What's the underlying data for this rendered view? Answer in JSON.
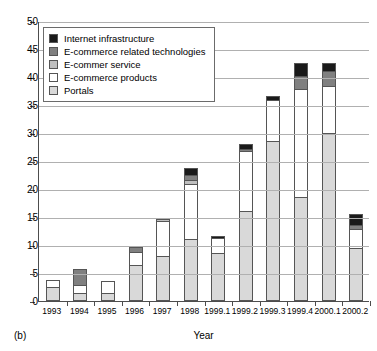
{
  "chart_data": {
    "type": "bar",
    "subtype": "stacked-bar",
    "title": "",
    "panel_label": "(b)",
    "xlabel": "Year",
    "ylabel": "",
    "ylim": [
      0,
      50
    ],
    "ytick_step": 5,
    "ytick_labels": [
      "0",
      "5",
      "10",
      "15",
      "20",
      "25",
      "30",
      "35",
      "40",
      "45",
      "50"
    ],
    "grid": true,
    "grid_axis": "y",
    "legend_position": "top-left",
    "categories": [
      "1993",
      "1994",
      "1995",
      "1996",
      "1997",
      "1998",
      "1999.1",
      "1999.2",
      "1999.3",
      "1999.4",
      "2000.1",
      "2000.2"
    ],
    "series": [
      {
        "name": "Portals",
        "color": "#d9d9d9",
        "values": [
          2.5,
          1.5,
          1.5,
          6.5,
          8.0,
          11.0,
          8.5,
          16.0,
          28.5,
          18.5,
          30.0,
          9.5
        ]
      },
      {
        "name": "E-commerce products",
        "color": "#ffffff",
        "values": [
          1.5,
          1.5,
          2.3,
          2.5,
          6.5,
          10.0,
          3.0,
          11.0,
          7.5,
          19.5,
          8.5,
          3.5
        ]
      },
      {
        "name": "E-commer service",
        "color": "#bfbfbf",
        "values": [
          0.0,
          0.0,
          0.0,
          0.0,
          0.5,
          1.0,
          0.0,
          0.0,
          0.0,
          0.0,
          0.0,
          0.0
        ]
      },
      {
        "name": "E-commerce related technologies",
        "color": "#808080",
        "values": [
          0.0,
          3.0,
          0.0,
          1.0,
          0.0,
          1.0,
          0.0,
          0.5,
          0.0,
          2.5,
          3.0,
          1.0
        ]
      },
      {
        "name": "Internet infrastructure",
        "color": "#1a1a1a",
        "values": [
          0.0,
          0.0,
          0.0,
          0.0,
          0.0,
          1.5,
          0.5,
          1.0,
          1.0,
          2.5,
          1.5,
          2.0
        ]
      }
    ],
    "totals": [
      4.0,
      6.0,
      3.8,
      10.0,
      15.0,
      24.5,
      12.0,
      28.5,
      37.0,
      43.0,
      43.0,
      16.0
    ],
    "legend_entries": [
      {
        "label": "Internet infrastructure",
        "color": "#1a1a1a"
      },
      {
        "label": "E-commerce related technologies",
        "color": "#808080"
      },
      {
        "label": "E-commer service",
        "color": "#bfbfbf"
      },
      {
        "label": "E-commerce products",
        "color": "#ffffff"
      },
      {
        "label": "Portals",
        "color": "#d9d9d9"
      }
    ]
  }
}
